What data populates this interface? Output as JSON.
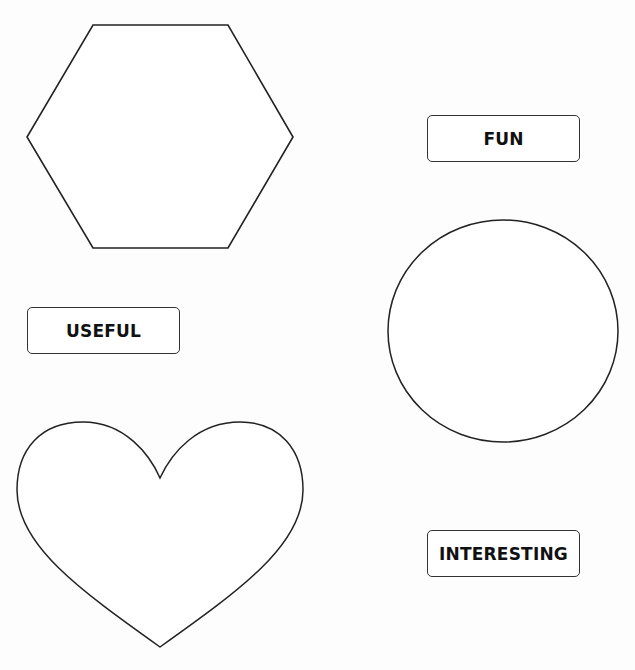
{
  "worksheet": {
    "shapes": [
      {
        "id": "hexagon",
        "label": "hexagon"
      },
      {
        "id": "circle",
        "label": "circle"
      },
      {
        "id": "heart",
        "label": "heart"
      }
    ],
    "labels": [
      {
        "id": "fun",
        "text": "FUN"
      },
      {
        "id": "useful",
        "text": "USEFUL"
      },
      {
        "id": "interesting",
        "text": "INTERESTING"
      }
    ],
    "colors": {
      "background": "#ffffff",
      "stroke": "#222222",
      "text": "#111111"
    }
  }
}
